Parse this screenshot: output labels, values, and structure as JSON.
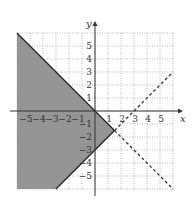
{
  "chart_data": {
    "type": "line",
    "title": "",
    "xlabel": "x",
    "ylabel": "y",
    "xlim": [
      -6,
      6
    ],
    "ylim": [
      -6,
      6
    ],
    "grid": true,
    "x_ticks": [
      -5,
      -4,
      -3,
      -2,
      -1,
      1,
      2,
      3,
      4,
      5
    ],
    "y_ticks": [
      5,
      4,
      3,
      2,
      1,
      -1,
      -2,
      -3,
      -4,
      -5
    ],
    "x_tick_labels": [
      "−5",
      "−4",
      "−3",
      "−2",
      "−1",
      "1",
      "2",
      "3",
      "4",
      "5"
    ],
    "y_tick_labels": [
      "5",
      "4",
      "3",
      "2",
      "1",
      "−1",
      "−2",
      "−3",
      "−4",
      "−5"
    ],
    "series": [
      {
        "name": "y = -x",
        "style": "solid boundary, dashed continuation",
        "points": [
          [
            -6,
            6
          ],
          [
            1.5,
            -1.5
          ],
          [
            6,
            -6
          ]
        ]
      },
      {
        "name": "y = x - 3",
        "style": "solid boundary, dashed continuation",
        "points": [
          [
            -3,
            -6
          ],
          [
            1.5,
            -1.5
          ],
          [
            6,
            3
          ]
        ]
      }
    ],
    "shaded_region": {
      "description": "y <= -x and y >= x - 3",
      "vertices": [
        [
          -6,
          6
        ],
        [
          1.5,
          -1.5
        ],
        [
          -3,
          -6
        ],
        [
          -6,
          -6
        ]
      ],
      "color": "#8a8a8a"
    },
    "intersection": [
      1.5,
      -1.5
    ]
  }
}
